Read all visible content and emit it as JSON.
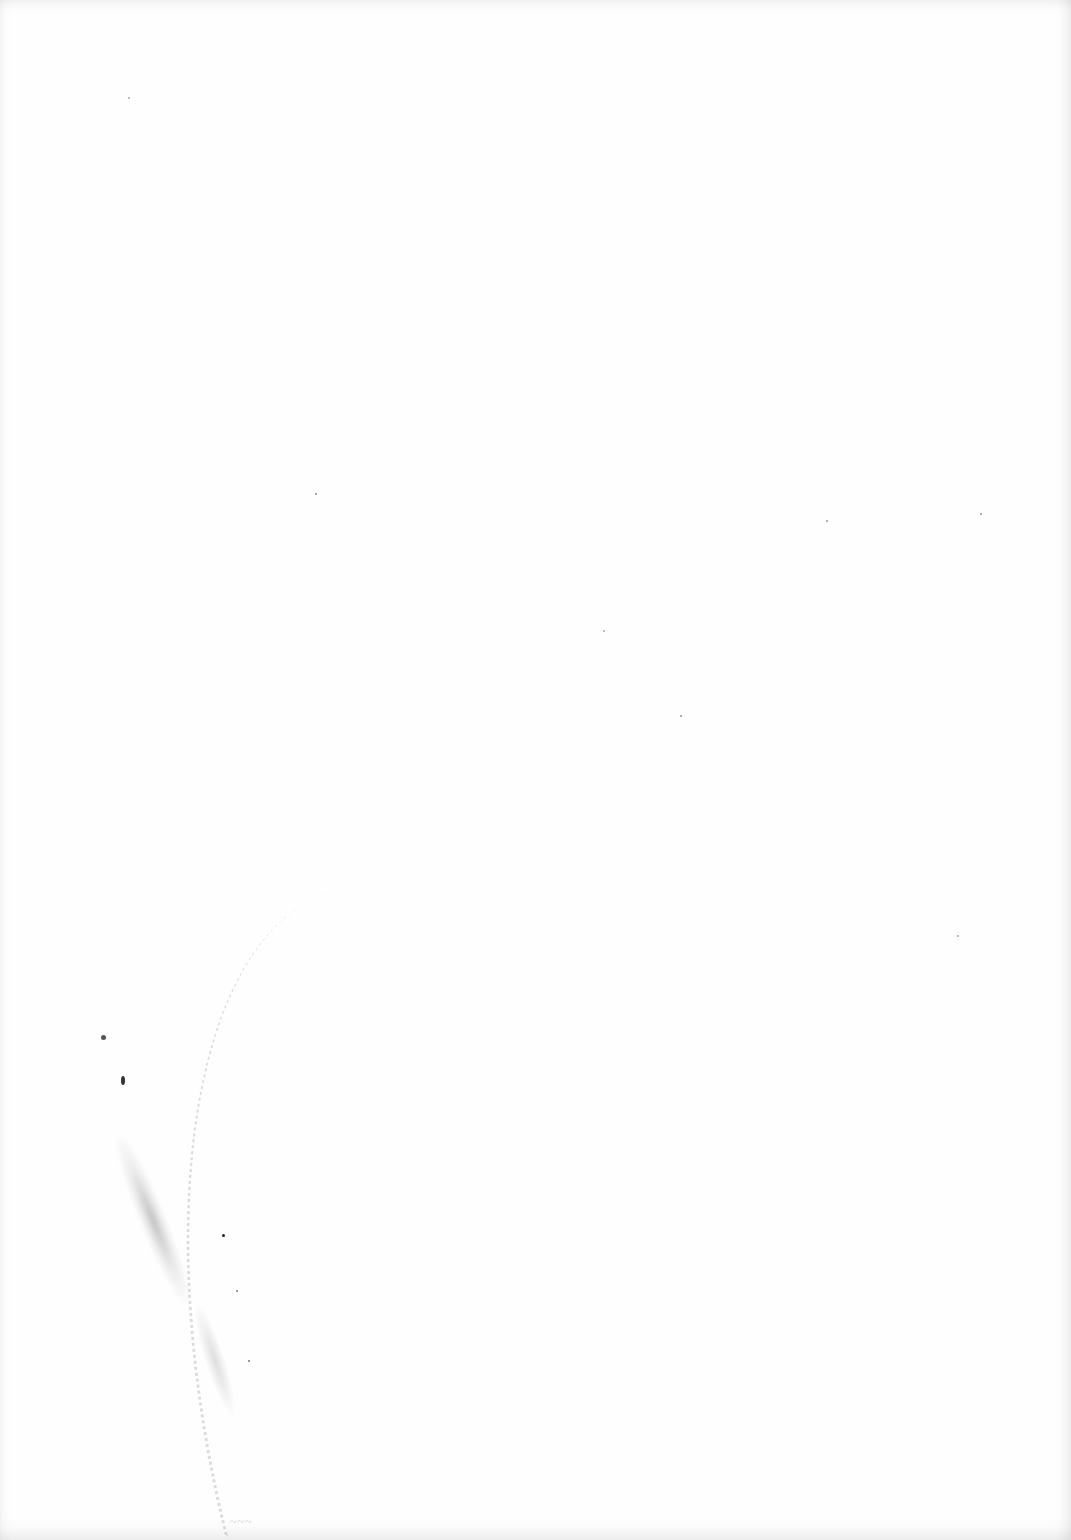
{
  "document": {
    "type": "blank scanned page",
    "text": "",
    "scribble": "~~~"
  },
  "colors": {
    "paper": "#fefefe",
    "marks": "#555555"
  }
}
